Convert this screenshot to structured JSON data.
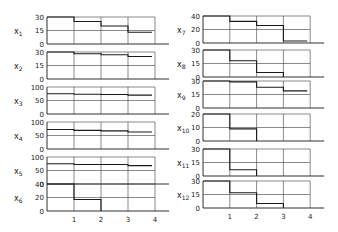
{
  "chart_data": {
    "type": "step",
    "title": "",
    "xlabel": "",
    "x_ticks": [
      "1",
      "2",
      "3",
      "4"
    ],
    "xlim": [
      0,
      4
    ],
    "layout": "two columns of six stacked step-plot panels sharing x axis",
    "panels": [
      {
        "name": "x1",
        "column": 0,
        "row": 0,
        "yticks": [
          "0",
          "15",
          "30"
        ],
        "ylim": [
          0,
          30
        ],
        "steps": [
          30,
          25,
          20,
          13
        ],
        "gridline": 15
      },
      {
        "name": "x2",
        "column": 0,
        "row": 1,
        "yticks": [
          "0",
          "15",
          "30"
        ],
        "ylim": [
          0,
          30
        ],
        "steps": [
          30,
          28,
          27,
          25
        ],
        "gridline": 15
      },
      {
        "name": "x3",
        "column": 0,
        "row": 2,
        "yticks": [
          "0",
          "50",
          "100"
        ],
        "ylim": [
          0,
          100
        ],
        "steps": [
          75,
          73,
          72,
          70
        ],
        "gridline": 50
      },
      {
        "name": "x4",
        "column": 0,
        "row": 3,
        "yticks": [
          "0",
          "50",
          "100"
        ],
        "ylim": [
          0,
          100
        ],
        "steps": [
          72,
          69,
          67,
          63
        ],
        "gridline": 50
      },
      {
        "name": "x5",
        "column": 0,
        "row": 4,
        "yticks": [
          "0",
          "50",
          "100"
        ],
        "ylim": [
          0,
          100
        ],
        "steps": [
          75,
          72,
          72,
          68
        ],
        "gridline": 50
      },
      {
        "name": "x6",
        "column": 0,
        "row": 5,
        "yticks": [
          "0",
          "20",
          "40"
        ],
        "ylim": [
          0,
          40
        ],
        "steps": [
          40,
          17,
          null,
          null
        ],
        "gridline": 20
      },
      {
        "name": "x7",
        "column": 1,
        "row": 0,
        "yticks": [
          "0",
          "20",
          "40"
        ],
        "ylim": [
          0,
          40
        ],
        "steps": [
          40,
          32,
          26,
          3
        ],
        "gridline": 20
      },
      {
        "name": "x8",
        "column": 1,
        "row": 1,
        "yticks": [
          "0",
          "15",
          "30"
        ],
        "ylim": [
          0,
          30
        ],
        "steps": [
          30,
          18,
          5,
          null
        ],
        "gridline": 15
      },
      {
        "name": "x9",
        "column": 1,
        "row": 2,
        "yticks": [
          "0",
          "15",
          "30"
        ],
        "ylim": [
          0,
          30
        ],
        "steps": [
          30,
          29,
          23,
          19
        ],
        "gridline": 15
      },
      {
        "name": "x10",
        "column": 1,
        "row": 3,
        "yticks": [
          "0",
          "10",
          "20"
        ],
        "ylim": [
          0,
          20
        ],
        "steps": [
          20,
          9,
          null,
          null
        ],
        "gridline": 10
      },
      {
        "name": "x11",
        "column": 1,
        "row": 4,
        "yticks": [
          "0",
          "15",
          "30"
        ],
        "ylim": [
          0,
          30
        ],
        "steps": [
          30,
          7,
          null,
          null
        ],
        "gridline": 15
      },
      {
        "name": "x12",
        "column": 1,
        "row": 5,
        "yticks": [
          "0",
          "15",
          "30"
        ],
        "ylim": [
          0,
          30
        ],
        "steps": [
          30,
          17,
          5,
          null
        ],
        "gridline": 15
      }
    ]
  },
  "style": {
    "ink": "#1a1a1a",
    "grid": "#3a3a3a",
    "background": "#ffffff"
  }
}
